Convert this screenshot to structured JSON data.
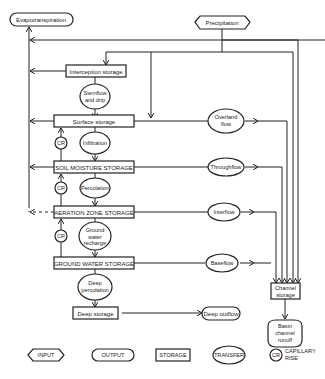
{
  "inputs": {
    "precipitation": "Precipitation"
  },
  "outputs": {
    "evapotranspiration": "Evapotranspiration",
    "deep_outflow": "Deep outflow",
    "basin_runoff": [
      "Basin",
      "channel",
      "runoff"
    ]
  },
  "storages": {
    "interception": "Interception storage",
    "surface": "Surface storage",
    "soil_moisture": "SOIL MOISTURE STORAGE",
    "aeration": "AERATION ZONE STORAGE",
    "ground_water": "GROUND WATER STORAGE",
    "deep": "Deep storage",
    "channel": [
      "Channel",
      "storage"
    ]
  },
  "transfers": {
    "stemflow": [
      "Stemflow",
      "and drip"
    ],
    "infiltration": "Infiltration",
    "percolation": "Percolation",
    "gw_recharge": [
      "Ground",
      "water",
      "recharge"
    ],
    "deep_percolation": [
      "Deep",
      "percolation"
    ],
    "overland": [
      "Overland",
      "flow"
    ],
    "throughflow": "Throughflow",
    "interflow": "Interflow",
    "baseflow": "Baseflow"
  },
  "capillary_rise_label": "CR",
  "legend": {
    "input": "INPUT",
    "output": "OUTPUT",
    "storage": "STORAGE",
    "transfer": "TRANSFER",
    "cr": "CR",
    "capillary_rise": [
      "CAPILLARY",
      "RISE"
    ]
  }
}
